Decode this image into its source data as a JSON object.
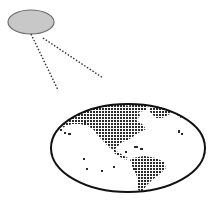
{
  "diagram": {
    "type": "illustration",
    "source": {
      "shape": "ellipse",
      "fill": "#c8c8c8",
      "stroke": "#6e6e6e"
    },
    "beam": {
      "style": "dotted",
      "color": "#333333"
    },
    "globe": {
      "shape": "ellipse",
      "outline": "#111111",
      "land_fill": "#333333",
      "ocean_fill": "#ffffff",
      "regions_shown": [
        "North America",
        "Greenland",
        "South America",
        "Pacific islands"
      ]
    }
  }
}
